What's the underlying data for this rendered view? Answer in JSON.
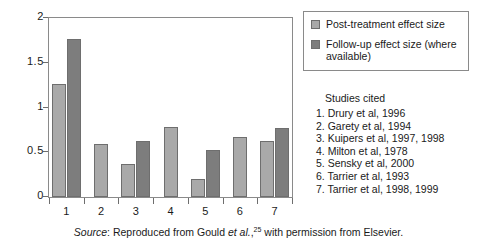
{
  "chart_data": {
    "type": "bar",
    "title": "",
    "xlabel": "",
    "ylabel": "",
    "ylim": [
      0,
      2
    ],
    "yticks": [
      "0",
      "0.5",
      "1",
      "1.5",
      "2"
    ],
    "ytick_values": [
      0,
      0.5,
      1,
      1.5,
      2
    ],
    "grid": false,
    "legend_position": "right-top",
    "categories": [
      "1",
      "2",
      "3",
      "4",
      "5",
      "6",
      "7"
    ],
    "series": [
      {
        "name": "Post-treatment effect size",
        "color": "#a9a9a9",
        "values": [
          1.26,
          0.59,
          0.37,
          0.78,
          0.2,
          0.67,
          0.63
        ]
      },
      {
        "name": "Follow-up effect size (where available)",
        "color": "#7d7d7d",
        "values": [
          1.77,
          null,
          0.63,
          null,
          0.52,
          null,
          0.77
        ]
      }
    ]
  },
  "legend": {
    "items": [
      {
        "swatch": "post",
        "label": "Post-treatment effect size"
      },
      {
        "swatch": "follow",
        "label": "Follow-up effect size (where available)"
      }
    ]
  },
  "studies": {
    "title": "Studies cited",
    "items": [
      "1. Drury et al, 1996",
      "2. Garety et al, 1994",
      "3. Kuipers et al, 1997, 1998",
      "4. Milton et al, 1978",
      "5. Sensky et al, 2000",
      "6. Tarrier et al, 1993",
      "7. Tarrier et al, 1998, 1999"
    ]
  },
  "source": {
    "label": "Source",
    "colon": ": ",
    "text_before": "Reproduced from Gould ",
    "etal": "et al.",
    "comma": ",",
    "superscript": "25",
    "text_after": " with permission from Elsevier."
  },
  "colors": {
    "post_bar": "#a9a9a9",
    "follow_bar": "#7d7d7d",
    "axis": "#6e6e6e",
    "text": "#1a1a1a",
    "background": "#ffffff"
  }
}
